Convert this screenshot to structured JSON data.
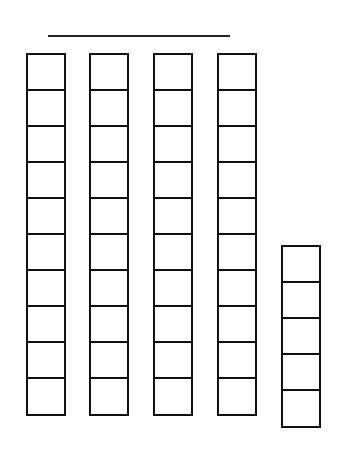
{
  "problem": {
    "label_fragment": ")",
    "answer_line": ""
  },
  "blocks": {
    "tens_rods": 4,
    "cells_per_rod": 10,
    "ones_cubes": 5,
    "rods": [
      {
        "type": "ten",
        "cells": 10,
        "left": 26,
        "top": 53
      },
      {
        "type": "ten",
        "cells": 10,
        "left": 89,
        "top": 53
      },
      {
        "type": "ten",
        "cells": 10,
        "left": 153,
        "top": 53
      },
      {
        "type": "ten",
        "cells": 10,
        "left": 217,
        "top": 53
      },
      {
        "type": "ones",
        "cells": 5,
        "left": 281,
        "top": 245
      }
    ]
  },
  "colors": {
    "stroke": "#111111",
    "background": "#ffffff"
  }
}
